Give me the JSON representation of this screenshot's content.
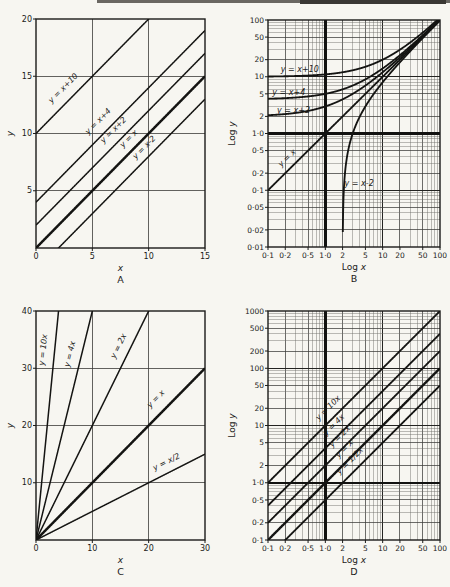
{
  "page": {
    "background": "#f7f6f1",
    "ink": "#1b1b19",
    "cropped_header_text": ""
  },
  "chart_data": [
    {
      "id": "A",
      "panel_label": "A",
      "type": "line",
      "scale": "linear",
      "xlabel": "x",
      "ylabel": "y",
      "xlim": [
        0,
        15
      ],
      "ylim": [
        0,
        20
      ],
      "grid": "on",
      "xticks": [
        {
          "v": 0,
          "label": "0"
        },
        {
          "v": 5,
          "label": "5"
        },
        {
          "v": 10,
          "label": "10"
        },
        {
          "v": 15,
          "label": "15"
        }
      ],
      "yticks": [
        {
          "v": 5,
          "label": "5"
        },
        {
          "v": 10,
          "label": "10"
        },
        {
          "v": 15,
          "label": "15"
        },
        {
          "v": 20,
          "label": "20"
        }
      ],
      "series": [
        {
          "label": "y = x+10",
          "m": 1,
          "c": 10,
          "bold": false,
          "lab": {
            "rot": true,
            "x": 3.2,
            "d": 10
          }
        },
        {
          "label": "y = x+4",
          "m": 1,
          "c": 4,
          "bold": false,
          "lab": {
            "rot": true,
            "x": 6.3,
            "d": 10
          }
        },
        {
          "label": "y = x+2",
          "m": 1,
          "c": 2,
          "bold": false,
          "lab": {
            "rot": true,
            "x": 7.6,
            "d": 9
          }
        },
        {
          "label": "y = x",
          "m": 1,
          "c": 0,
          "bold": true,
          "lab": {
            "rot": true,
            "x": 8.9,
            "d": 8
          }
        },
        {
          "label": "y = x-2",
          "m": 1,
          "c": -2,
          "bold": false,
          "lab": {
            "rot": true,
            "x": 10.2,
            "d": 7
          }
        }
      ]
    },
    {
      "id": "B",
      "panel_label": "B",
      "type": "line",
      "scale": "log",
      "xlabel": "Log x",
      "ylabel": "Log y",
      "xlim": [
        0.1,
        100
      ],
      "ylim": [
        0.01,
        100
      ],
      "grid": "log",
      "unit_lines": {
        "x": 1,
        "y": 1
      },
      "xticks": [
        {
          "v": 0.1,
          "label": "0·1"
        },
        {
          "v": 0.2,
          "label": "0·2"
        },
        {
          "v": 0.5,
          "label": "0·5"
        },
        {
          "v": 1,
          "label": "1·0"
        },
        {
          "v": 2,
          "label": "2"
        },
        {
          "v": 5,
          "label": "5"
        },
        {
          "v": 10,
          "label": "10"
        },
        {
          "v": 20,
          "label": "20"
        },
        {
          "v": 50,
          "label": "50"
        },
        {
          "v": 100,
          "label": "100"
        }
      ],
      "yticks": [
        {
          "v": 100,
          "label": "100"
        },
        {
          "v": 50,
          "label": "50"
        },
        {
          "v": 20,
          "label": "20"
        },
        {
          "v": 10,
          "label": "10"
        },
        {
          "v": 5,
          "label": "5"
        },
        {
          "v": 2,
          "label": "2"
        },
        {
          "v": 1,
          "label": "1·0"
        },
        {
          "v": 0.5,
          "label": "0·5"
        },
        {
          "v": 0.2,
          "label": "0·2"
        },
        {
          "v": 0.1,
          "label": "0·1"
        },
        {
          "v": 0.05,
          "label": "0·05"
        },
        {
          "v": 0.02,
          "label": "0·02"
        },
        {
          "v": 0.01,
          "label": "0·01"
        }
      ],
      "series": [
        {
          "label": "y = x+10",
          "m": 1,
          "c": 10,
          "bold": false,
          "lab": {
            "rot": false,
            "x": 0.36,
            "y": 13.5
          }
        },
        {
          "label": "y = x+4",
          "m": 1,
          "c": 4,
          "bold": false,
          "lab": {
            "rot": false,
            "x": 0.23,
            "y": 5.4
          }
        },
        {
          "label": "y = x+2",
          "m": 1,
          "c": 2,
          "bold": false,
          "lab": {
            "rot": false,
            "x": 0.28,
            "y": 2.6
          }
        },
        {
          "label": "y = x",
          "m": 1,
          "c": 0,
          "bold": false,
          "lab": {
            "rot": true,
            "x": 0.28,
            "d": 7
          }
        },
        {
          "label": "y = x-2",
          "m": 1,
          "c": -2,
          "bold": false,
          "lab": {
            "rot": false,
            "x": 3.9,
            "y": 0.135
          }
        }
      ]
    },
    {
      "id": "C",
      "panel_label": "C",
      "type": "line",
      "scale": "linear",
      "xlabel": "x",
      "ylabel": "y",
      "xlim": [
        0,
        30
      ],
      "ylim": [
        0,
        40
      ],
      "grid": "on",
      "xticks": [
        {
          "v": 0,
          "label": "0"
        },
        {
          "v": 10,
          "label": "10"
        },
        {
          "v": 20,
          "label": "20"
        },
        {
          "v": 30,
          "label": "30"
        }
      ],
      "yticks": [
        {
          "v": 10,
          "label": "10"
        },
        {
          "v": 20,
          "label": "20"
        },
        {
          "v": 30,
          "label": "30"
        },
        {
          "v": 40,
          "label": "40"
        }
      ],
      "series": [
        {
          "label": "y = 10x",
          "m": 10,
          "c": 0,
          "bold": false,
          "lab": {
            "rot": true,
            "x": 3.3,
            "d": 9
          }
        },
        {
          "label": "y = 4x",
          "m": 4,
          "c": 0,
          "bold": false,
          "lab": {
            "rot": true,
            "x": 8.0,
            "d": 9
          }
        },
        {
          "label": "y = 2x",
          "m": 2,
          "c": 0,
          "bold": false,
          "lab": {
            "rot": true,
            "x": 16.5,
            "d": 9
          }
        },
        {
          "label": "y = x",
          "m": 1,
          "c": 0,
          "bold": true,
          "lab": {
            "rot": true,
            "x": 23,
            "d": 11
          }
        },
        {
          "label": "y = x/2",
          "m": 0.5,
          "c": 0,
          "bold": false,
          "lab": {
            "rot": true,
            "x": 24,
            "d": 8
          }
        }
      ]
    },
    {
      "id": "D",
      "panel_label": "D",
      "type": "line",
      "scale": "log",
      "xlabel": "Log x",
      "ylabel": "Log y",
      "xlim": [
        0.1,
        100
      ],
      "ylim": [
        0.1,
        1000
      ],
      "grid": "log",
      "unit_lines": {
        "x": 1,
        "y": 1
      },
      "xticks": [
        {
          "v": 0.1,
          "label": "0·1"
        },
        {
          "v": 0.2,
          "label": "0·2"
        },
        {
          "v": 0.5,
          "label": "0·5"
        },
        {
          "v": 1,
          "label": "1·0"
        },
        {
          "v": 2,
          "label": "2"
        },
        {
          "v": 5,
          "label": "5"
        },
        {
          "v": 10,
          "label": "10"
        },
        {
          "v": 20,
          "label": "20"
        },
        {
          "v": 50,
          "label": "50"
        },
        {
          "v": 100,
          "label": "100"
        }
      ],
      "yticks": [
        {
          "v": 1000,
          "label": "1000"
        },
        {
          "v": 500,
          "label": "500"
        },
        {
          "v": 200,
          "label": "200"
        },
        {
          "v": 100,
          "label": "100"
        },
        {
          "v": 50,
          "label": "50"
        },
        {
          "v": 20,
          "label": "20"
        },
        {
          "v": 10,
          "label": "10"
        },
        {
          "v": 5,
          "label": "5"
        },
        {
          "v": 2,
          "label": "2"
        },
        {
          "v": 1,
          "label": "1·0"
        },
        {
          "v": 0.5,
          "label": "0·5"
        },
        {
          "v": 0.2,
          "label": "0·2"
        },
        {
          "v": 0.1,
          "label": "0·1"
        }
      ],
      "series": [
        {
          "label": "y = 10x",
          "m": 10,
          "c": 0,
          "bold": false,
          "lab": {
            "rot": true,
            "x": 1.5,
            "d": 8
          }
        },
        {
          "label": "y = 4x",
          "m": 4,
          "c": 0,
          "bold": false,
          "lab": {
            "rot": true,
            "x": 1.9,
            "d": 8
          }
        },
        {
          "label": "y = 2x",
          "m": 2,
          "c": 0,
          "bold": false,
          "lab": {
            "rot": true,
            "x": 2.4,
            "d": 8
          }
        },
        {
          "label": "y = x",
          "m": 1,
          "c": 0,
          "bold": true,
          "lab": {
            "rot": true,
            "x": 2.9,
            "d": 8
          }
        },
        {
          "label": "y = 1/2x",
          "m": 0.5,
          "c": 0,
          "bold": false,
          "lab": {
            "rot": true,
            "x": 3.6,
            "d": 8
          }
        }
      ]
    }
  ]
}
